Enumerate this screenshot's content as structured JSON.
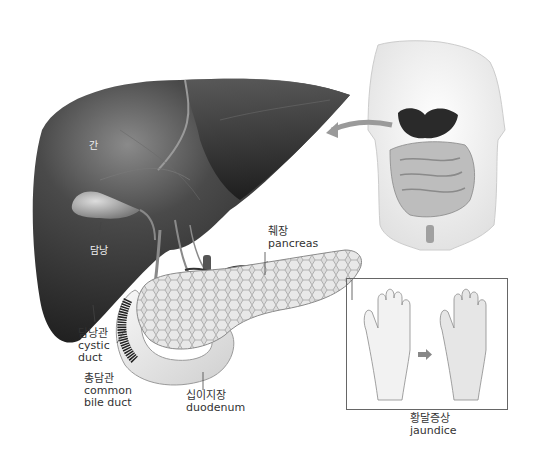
{
  "figure": {
    "colors": {
      "liver_dark": "#2e2e2e",
      "liver_mid": "#555555",
      "pancreas": "#d8d8d8",
      "duodenum": "#efefef",
      "label_text": "#333333",
      "box_border": "#666666"
    }
  },
  "labels": {
    "liver": {
      "ko": "간"
    },
    "gallbladder": {
      "ko": "담낭"
    },
    "pancreas": {
      "ko": "췌장",
      "en": "pancreas"
    },
    "cystic_duct": {
      "ko": "담낭관",
      "en_line1": "cystic",
      "en_line2": "duct"
    },
    "common_bile_duct": {
      "ko": "총담관",
      "en_line1": "common",
      "en_line2": "bile duct"
    },
    "duodenum": {
      "ko": "십이지장",
      "en": "duodenum"
    },
    "jaundice": {
      "ko": "황달증상",
      "en": "jaundice"
    }
  },
  "icons": {
    "location_arrow": "curved-arrow-left",
    "jaundice_arrow": "right-arrow"
  }
}
